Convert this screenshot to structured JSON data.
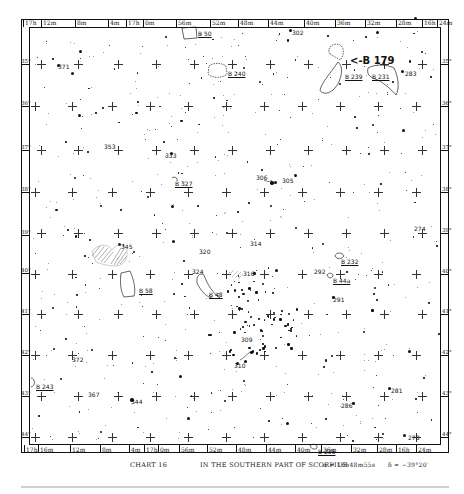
{
  "chart_data": {
    "type": "table",
    "title": "CHART 16",
    "subtitle": "IN THE SOUTHERN PART OF SCORPIUS",
    "center": {
      "ra": "α=16h48m55s",
      "dec": "δ=−39°20′"
    },
    "ra_ticks_top": [
      "17h",
      "12m",
      "8m",
      "4m",
      "17h",
      "0m",
      "56m",
      "52m",
      "48m",
      "44m",
      "40m",
      "36m",
      "32m",
      "28m",
      "16h",
      "24m"
    ],
    "ra_ticks_bottom": [
      "17h",
      "16m",
      "12m",
      "8m",
      "4m",
      "17h",
      "0m",
      "56m",
      "52m",
      "48m",
      "44m",
      "40m",
      "36m",
      "32m",
      "28m",
      "16h",
      "24m"
    ],
    "dec_ticks": [
      "35°",
      "36°",
      "37°",
      "38°",
      "39°",
      "40°",
      "41°",
      "42°",
      "43°",
      "44°"
    ],
    "dark_nebulae": [
      "B 50",
      "B 240",
      "B 179",
      "B 239",
      "B 231",
      "B 327",
      "B 58",
      "B 48",
      "B 232",
      "B 44a",
      "B 243",
      "B 235"
    ],
    "numbered_objects": [
      "302",
      "371",
      "283",
      "353",
      "333",
      "306",
      "305",
      "274",
      "345",
      "320",
      "314",
      "324",
      "316",
      "292",
      "291",
      "372",
      "309",
      "310",
      "243",
      "367",
      "344",
      "281",
      "286",
      "278"
    ]
  },
  "caption": {
    "chart": "CHART 16",
    "region": "IN THE SOUTHERN PART OF SCORPIUS",
    "alpha": "α = 16h48m55s",
    "delta": "δ = −39°20′"
  },
  "ra_top": [
    {
      "text": "17h",
      "x": 25
    },
    {
      "text": "12m",
      "x": 43
    },
    {
      "text": "8m",
      "x": 77
    },
    {
      "text": "4m",
      "x": 110
    },
    {
      "text": "17h",
      "x": 128
    },
    {
      "text": "0m",
      "x": 145
    },
    {
      "text": "56m",
      "x": 178
    },
    {
      "text": "52m",
      "x": 212
    },
    {
      "text": "48m",
      "x": 240
    },
    {
      "text": "44m",
      "x": 270
    },
    {
      "text": "40m",
      "x": 306
    },
    {
      "text": "36m",
      "x": 337
    },
    {
      "text": "32m",
      "x": 367
    },
    {
      "text": "28m",
      "x": 398
    },
    {
      "text": "16h",
      "x": 424
    },
    {
      "text": "24m",
      "x": 439
    }
  ],
  "ra_bottom": [
    {
      "text": "17h",
      "x": 26
    },
    {
      "text": "16m",
      "x": 40
    },
    {
      "text": "12m",
      "x": 72
    },
    {
      "text": "8m",
      "x": 102
    },
    {
      "text": "4m",
      "x": 131
    },
    {
      "text": "17h",
      "x": 146
    },
    {
      "text": "0m",
      "x": 160
    },
    {
      "text": "56m",
      "x": 181
    },
    {
      "text": "52m",
      "x": 209
    },
    {
      "text": "48m",
      "x": 238
    },
    {
      "text": "44m",
      "x": 268
    },
    {
      "text": "40m",
      "x": 297
    },
    {
      "text": "36m",
      "x": 323
    },
    {
      "text": "32m",
      "x": 353
    },
    {
      "text": "28m",
      "x": 379
    },
    {
      "text": "16h",
      "x": 398
    },
    {
      "text": "24m",
      "x": 418
    }
  ],
  "dec_left": [
    {
      "text": "35°",
      "y": 64
    },
    {
      "text": "36°",
      "y": 106
    },
    {
      "text": "37°",
      "y": 150
    },
    {
      "text": "38°",
      "y": 192
    },
    {
      "text": "39°",
      "y": 235
    },
    {
      "text": "40°",
      "y": 273
    },
    {
      "text": "41°",
      "y": 314
    },
    {
      "text": "42°",
      "y": 355
    },
    {
      "text": "43°",
      "y": 396
    },
    {
      "text": "44°",
      "y": 437
    }
  ],
  "dec_right": [
    {
      "text": "35°",
      "y": 64
    },
    {
      "text": "36°",
      "y": 106
    },
    {
      "text": "37°",
      "y": 150
    },
    {
      "text": "38°",
      "y": 192
    },
    {
      "text": "39°",
      "y": 233
    },
    {
      "text": "40°",
      "y": 274
    },
    {
      "text": "41°",
      "y": 314
    },
    {
      "text": "42°",
      "y": 355
    },
    {
      "text": "43°",
      "y": 396
    },
    {
      "text": "44°",
      "y": 437
    }
  ],
  "labels": [
    {
      "text": "B 50",
      "x": 198,
      "y": 30,
      "u": true
    },
    {
      "text": "302",
      "x": 292,
      "y": 29
    },
    {
      "text": "371",
      "x": 58,
      "y": 63
    },
    {
      "text": "B 240",
      "x": 228,
      "y": 70,
      "u": true
    },
    {
      "text": "<-B 179",
      "x": 350,
      "y": 55,
      "big": true
    },
    {
      "text": "B 239",
      "x": 345,
      "y": 73,
      "u": true
    },
    {
      "text": "B 231",
      "x": 372,
      "y": 73,
      "u": true
    },
    {
      "text": "283",
      "x": 405,
      "y": 70
    },
    {
      "text": "353",
      "x": 104,
      "y": 143
    },
    {
      "text": "333",
      "x": 165,
      "y": 152
    },
    {
      "text": "B 327",
      "x": 175,
      "y": 180,
      "u": true
    },
    {
      "text": "306",
      "x": 256,
      "y": 174
    },
    {
      "text": "305",
      "x": 282,
      "y": 177
    },
    {
      "text": "274",
      "x": 414,
      "y": 225
    },
    {
      "text": "345",
      "x": 121,
      "y": 243
    },
    {
      "text": "314",
      "x": 250,
      "y": 240
    },
    {
      "text": "320",
      "x": 199,
      "y": 248
    },
    {
      "text": "324",
      "x": 192,
      "y": 268
    },
    {
      "text": "316",
      "x": 243,
      "y": 270
    },
    {
      "text": "B 232",
      "x": 341,
      "y": 258,
      "u": true
    },
    {
      "text": "292",
      "x": 314,
      "y": 268
    },
    {
      "text": "B 44a",
      "x": 333,
      "y": 277,
      "u": true
    },
    {
      "text": "B 58",
      "x": 139,
      "y": 287,
      "u": true
    },
    {
      "text": "B 48",
      "x": 209,
      "y": 291,
      "u": true
    },
    {
      "text": "291",
      "x": 333,
      "y": 296
    },
    {
      "text": "309",
      "x": 241,
      "y": 336
    },
    {
      "text": "310",
      "x": 234,
      "y": 362
    },
    {
      "text": "372",
      "x": 72,
      "y": 356
    },
    {
      "text": "B 243",
      "x": 36,
      "y": 383,
      "u": true
    },
    {
      "text": "367",
      "x": 88,
      "y": 391
    },
    {
      "text": "344",
      "x": 131,
      "y": 398
    },
    {
      "text": "281",
      "x": 391,
      "y": 387
    },
    {
      "text": "286",
      "x": 341,
      "y": 402
    },
    {
      "text": "278",
      "x": 408,
      "y": 434
    },
    {
      "text": "B 235",
      "x": 318,
      "y": 448,
      "u": true
    }
  ]
}
